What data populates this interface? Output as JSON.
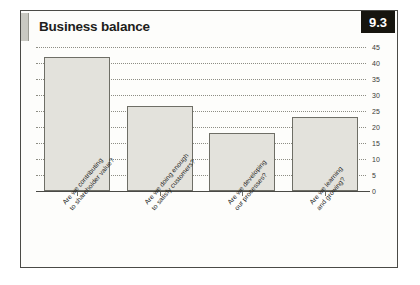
{
  "header": {
    "title": "Business balance",
    "badge": "9.3"
  },
  "chart_data": {
    "type": "bar",
    "title": "Business balance",
    "xlabel": "",
    "ylabel": "",
    "ylim": [
      0,
      45
    ],
    "grid": true,
    "legend": "none",
    "categories": [
      "Are we contributing\nto shareholder value?",
      "Are we doing enough\nto satisfy customers?",
      "Are we developing\nour processes?",
      "Are we learning\nand growing?"
    ],
    "values": [
      42,
      26.5,
      18,
      23
    ],
    "yticks": [
      0,
      5,
      10,
      15,
      20,
      25,
      30,
      35,
      40,
      45
    ],
    "bar_color": "#e3e2dc",
    "bar_edge_color": "#6e6e66",
    "grid_color": "#8d8d84",
    "axis_color": "#4a4a46"
  }
}
